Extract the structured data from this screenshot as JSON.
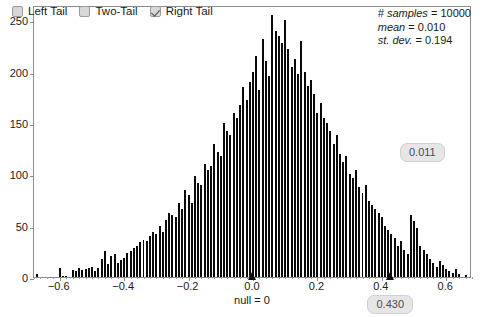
{
  "legend": {
    "items": [
      {
        "label": "Left Tail",
        "checked": false,
        "name": "left-tail"
      },
      {
        "label": "Two-Tail",
        "checked": false,
        "name": "two-tail"
      },
      {
        "label": "Right Tail",
        "checked": true,
        "name": "right-tail"
      }
    ]
  },
  "stats": {
    "samples_key": "# samples",
    "samples_value": "= 10000",
    "mean_key": "mean",
    "mean_value": "= 0.010",
    "stdev_key": "st. dev.",
    "stdev_value": "= 0.194"
  },
  "pills": {
    "p_value": "0.011",
    "statistic": "0.430"
  },
  "null_label": "null = 0",
  "colors": {
    "bar": "#0a0a0a",
    "frame": "#8c8c8c",
    "pill_bg": "#e6e6e6",
    "pill_text": "#4d4d4d",
    "checkbox_bg": "#d8d8d8"
  },
  "chart_data": {
    "type": "bar",
    "title": "",
    "subtitle": "",
    "xlabel": "",
    "ylabel": "",
    "grid": false,
    "legend_position": "top-left",
    "xlim": [
      -0.68,
      0.68
    ],
    "ylim": [
      0,
      265
    ],
    "xticks": [
      -0.6,
      -0.4,
      -0.2,
      0.0,
      0.2,
      0.4,
      0.6
    ],
    "xticklabels": [
      "−0.6",
      "−0.4",
      "−0.2",
      "0.0",
      "0.2",
      "0.4",
      "0.6"
    ],
    "yticks": [
      0,
      50,
      100,
      150,
      200,
      250
    ],
    "yticklabels": [
      "0",
      "50",
      "100",
      "150",
      "200",
      "250"
    ],
    "bin_width": 0.01,
    "annotations": [
      {
        "label": "null = 0",
        "x": 0.0,
        "kind": "marker"
      },
      {
        "label": "0.430",
        "x": 0.43,
        "kind": "marker"
      },
      {
        "label": "0.011",
        "kind": "pill"
      }
    ],
    "bins": [
      -0.67,
      -0.66,
      -0.65,
      -0.64,
      -0.63,
      -0.62,
      -0.61,
      -0.6,
      -0.59,
      -0.58,
      -0.57,
      -0.56,
      -0.55,
      -0.54,
      -0.53,
      -0.52,
      -0.51,
      -0.5,
      -0.49,
      -0.48,
      -0.47,
      -0.46,
      -0.45,
      -0.44,
      -0.43,
      -0.42,
      -0.41,
      -0.4,
      -0.39,
      -0.38,
      -0.37,
      -0.36,
      -0.35,
      -0.34,
      -0.33,
      -0.32,
      -0.31,
      -0.3,
      -0.29,
      -0.28,
      -0.27,
      -0.26,
      -0.25,
      -0.24,
      -0.23,
      -0.22,
      -0.21,
      -0.2,
      -0.19,
      -0.18,
      -0.17,
      -0.16,
      -0.15,
      -0.14,
      -0.13,
      -0.12,
      -0.11,
      -0.1,
      -0.09,
      -0.08,
      -0.07,
      -0.06,
      -0.05,
      -0.04,
      -0.03,
      -0.02,
      -0.01,
      0.0,
      0.01,
      0.02,
      0.03,
      0.04,
      0.05,
      0.06,
      0.07,
      0.08,
      0.09,
      0.1,
      0.11,
      0.12,
      0.13,
      0.14,
      0.15,
      0.16,
      0.17,
      0.18,
      0.19,
      0.2,
      0.21,
      0.22,
      0.23,
      0.24,
      0.25,
      0.26,
      0.27,
      0.28,
      0.29,
      0.3,
      0.31,
      0.32,
      0.33,
      0.34,
      0.35,
      0.36,
      0.37,
      0.38,
      0.39,
      0.4,
      0.41,
      0.42,
      0.43,
      0.44,
      0.45,
      0.46,
      0.47,
      0.48,
      0.49,
      0.5,
      0.51,
      0.52,
      0.53,
      0.54,
      0.55,
      0.56,
      0.57,
      0.58,
      0.59,
      0.6,
      0.61,
      0.62,
      0.63,
      0.64,
      0.65,
      0.66,
      0.67
    ],
    "counts": [
      3,
      0,
      0,
      0,
      0,
      0,
      0,
      9,
      1,
      1,
      0,
      7,
      6,
      9,
      7,
      8,
      9,
      10,
      6,
      9,
      18,
      25,
      13,
      20,
      22,
      14,
      17,
      19,
      23,
      25,
      28,
      30,
      34,
      36,
      35,
      40,
      44,
      42,
      50,
      44,
      56,
      62,
      60,
      58,
      72,
      66,
      85,
      80,
      72,
      98,
      92,
      90,
      110,
      104,
      108,
      130,
      122,
      118,
      150,
      142,
      138,
      160,
      155,
      168,
      185,
      172,
      190,
      200,
      215,
      182,
      232,
      210,
      196,
      255,
      240,
      235,
      228,
      250,
      222,
      205,
      212,
      198,
      230,
      200,
      186,
      192,
      178,
      160,
      170,
      155,
      150,
      142,
      130,
      138,
      120,
      112,
      118,
      100,
      96,
      104,
      88,
      82,
      90,
      74,
      70,
      66,
      62,
      58,
      50,
      46,
      42,
      38,
      30,
      35,
      26,
      22,
      60,
      55,
      48,
      30,
      26,
      22,
      18,
      14,
      10,
      16,
      12,
      8,
      6,
      4,
      8,
      3,
      0,
      2,
      0,
      0,
      6
    ]
  }
}
